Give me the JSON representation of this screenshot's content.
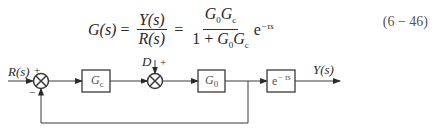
{
  "equation": {
    "lhs": "G(s)",
    "eq1": "=",
    "frac1_num": "Y(s)",
    "frac1_den": "R(s)",
    "eq2": "=",
    "frac2_num_a": "G",
    "frac2_num_a_sub": "0",
    "frac2_num_b": "G",
    "frac2_num_b_sub": "c",
    "frac2_den_prefix": "1 + ",
    "frac2_den_a": "G",
    "frac2_den_a_sub": "0",
    "frac2_den_b": "G",
    "frac2_den_b_sub": "c",
    "exp_base": "e",
    "exp_power": "−τs",
    "number": "(6 − 46)"
  },
  "diagram": {
    "input_label": "R(s)",
    "sum1_plus": "+",
    "sum1_minus": "−",
    "block1": {
      "main": "G",
      "sub": "c"
    },
    "disturbance_label": "D",
    "sum2_plus": "+",
    "block2": {
      "main": "G",
      "sub": "0"
    },
    "block3": {
      "main": "e",
      "sup": "− τs"
    },
    "output_label": "Y(s)"
  }
}
